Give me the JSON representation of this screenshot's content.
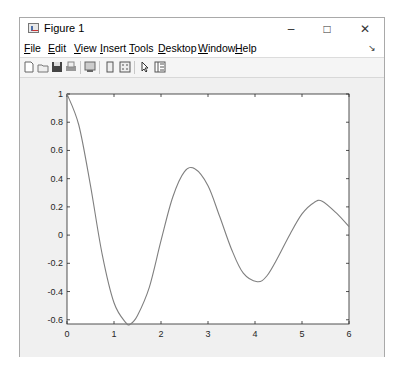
{
  "window": {
    "title": "Figure 1",
    "controls": {
      "minimize": "–",
      "maximize": "□",
      "close": "✕"
    }
  },
  "menubar": {
    "items": [
      {
        "label": "File",
        "accel": "F"
      },
      {
        "label": "Edit",
        "accel": "E"
      },
      {
        "label": "View",
        "accel": "V"
      },
      {
        "label": "Insert",
        "accel": "I"
      },
      {
        "label": "Tools",
        "accel": "T"
      },
      {
        "label": "Desktop",
        "accel": "D"
      },
      {
        "label": "Window",
        "accel": "W"
      },
      {
        "label": "Help",
        "accel": "H"
      }
    ],
    "dock_icon": "↘"
  },
  "toolbar": {
    "icons": [
      "new-figure-icon",
      "open-file-icon",
      "save-icon",
      "print-icon",
      "print-preview-icon",
      "link-plot-icon",
      "insert-legend-icon",
      "edit-plot-arrow-icon",
      "property-inspector-icon"
    ]
  },
  "chart_data": {
    "type": "line",
    "title": "",
    "xlabel": "",
    "ylabel": "",
    "xlim": [
      0,
      6
    ],
    "ylim": [
      -0.63,
      1
    ],
    "grid": false,
    "legend": null,
    "x_ticks": [
      "0",
      "1",
      "2",
      "3",
      "4",
      "5",
      "6"
    ],
    "y_ticks": [
      "1",
      "0.8",
      "0.6",
      "0.4",
      "0.2",
      "0",
      "-0.2",
      "-0.4",
      "-0.6"
    ],
    "line_color": "#7f7f7f",
    "series": [
      {
        "name": "y",
        "x": [
          0,
          0.25,
          0.5,
          0.75,
          1.0,
          1.25,
          1.35,
          1.5,
          1.75,
          2.0,
          2.25,
          2.5,
          2.72,
          3.0,
          3.25,
          3.5,
          3.75,
          4.05,
          4.25,
          4.5,
          4.75,
          5.0,
          5.25,
          5.43,
          5.75,
          6.0
        ],
        "values": [
          1.0,
          0.78,
          0.35,
          -0.14,
          -0.48,
          -0.62,
          -0.63,
          -0.57,
          -0.37,
          -0.04,
          0.27,
          0.45,
          0.47,
          0.35,
          0.13,
          -0.1,
          -0.27,
          -0.33,
          -0.29,
          -0.15,
          0.01,
          0.15,
          0.23,
          0.24,
          0.15,
          0.06
        ]
      }
    ]
  }
}
